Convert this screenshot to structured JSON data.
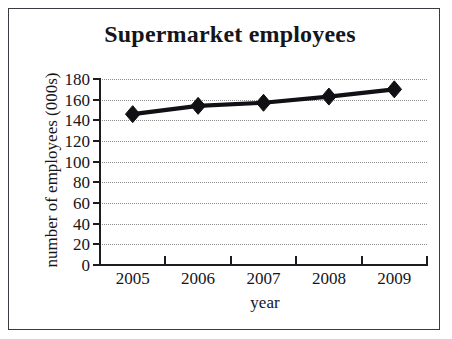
{
  "chart_data": {
    "type": "line",
    "title": "Supermarket employees",
    "xlabel": "year",
    "ylabel": "number of employees (000s)",
    "categories": [
      "2005",
      "2006",
      "2007",
      "2008",
      "2009"
    ],
    "values": [
      146,
      154,
      157,
      163,
      170
    ],
    "ylim": [
      0,
      180
    ],
    "ytick_labels": [
      "0",
      "20",
      "40",
      "60",
      "80",
      "100",
      "120",
      "140",
      "160",
      "180"
    ],
    "ytick_values": [
      0,
      20,
      40,
      60,
      80,
      100,
      120,
      140,
      160,
      180
    ],
    "grid": true,
    "grid_style": "dotted",
    "grid_color": "#8c8c8c",
    "legend": false,
    "series": [
      {
        "name": "Supermarket employees",
        "values": [
          146,
          154,
          157,
          163,
          170
        ],
        "marker": "diamond",
        "color": "#111115"
      }
    ],
    "axis_color": "#1c1c20",
    "background_color": "#ffffff",
    "border_color": "#3a3a42"
  }
}
